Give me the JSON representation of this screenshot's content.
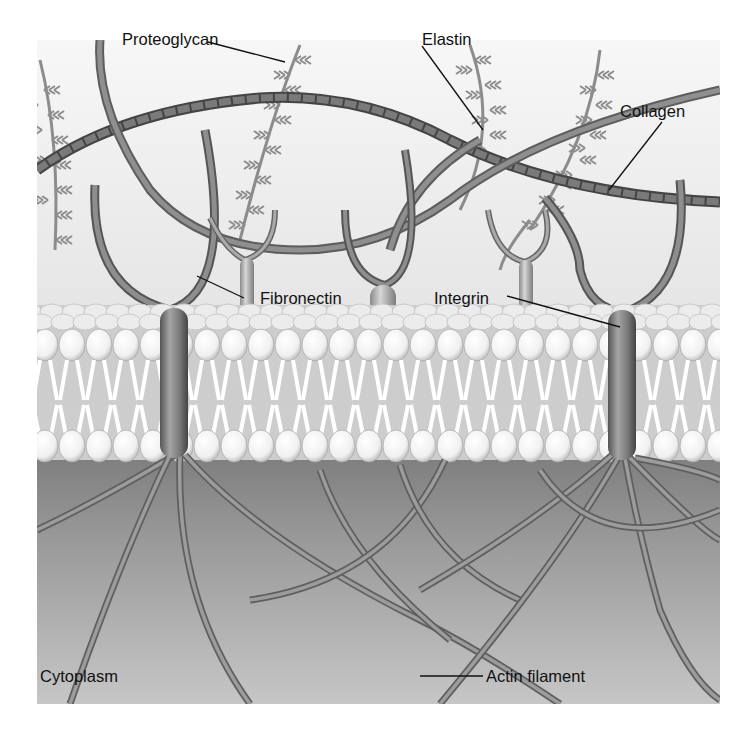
{
  "diagram": {
    "type": "biological-illustration",
    "regions": {
      "extracellular": {
        "color": "#f1f1f1"
      },
      "membrane": {
        "head_color": "#f7f7f7",
        "tail_color": "#ffffff",
        "bg_color": "#c9c9c9"
      },
      "cytoplasm": {
        "color_top": "#8a8a8a",
        "color_bottom": "#c4c4c4"
      }
    },
    "labels": {
      "proteoglycan": "Proteoglycan",
      "elastin": "Elastin",
      "collagen": "Collagen",
      "fibronectin": "Fibronectin",
      "integrin": "Integrin",
      "cytoplasm": "Cytoplasm",
      "actin_filament": "Actin filament"
    },
    "components": [
      {
        "name": "Proteoglycan",
        "count_visible": 5
      },
      {
        "name": "Elastin",
        "count_visible": 1
      },
      {
        "name": "Collagen",
        "count_visible": 1
      },
      {
        "name": "Fibronectin",
        "count_visible": 4
      },
      {
        "name": "Integrin",
        "count_visible": 2
      },
      {
        "name": "Actin filament",
        "count_visible": 12
      }
    ]
  }
}
